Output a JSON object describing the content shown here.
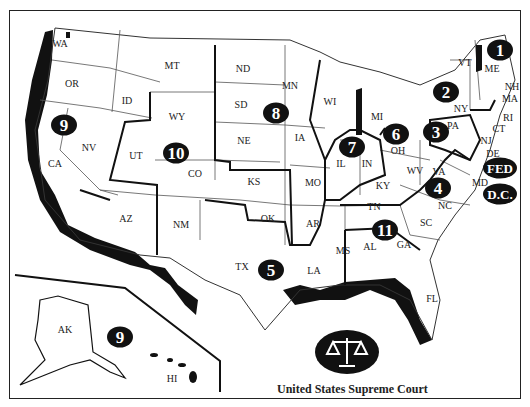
{
  "map": {
    "title": "United States Supreme Court",
    "seal_icon": "scales-of-justice",
    "colors": {
      "border": "#111111",
      "background": "#ffffff",
      "badge": "#111111",
      "badge_text": "#ffffff"
    },
    "states": [
      {
        "abbr": "WA",
        "x": 60,
        "y": 43
      },
      {
        "abbr": "OR",
        "x": 72,
        "y": 83
      },
      {
        "abbr": "CA",
        "x": 55,
        "y": 163
      },
      {
        "abbr": "NV",
        "x": 89,
        "y": 147
      },
      {
        "abbr": "ID",
        "x": 127,
        "y": 100
      },
      {
        "abbr": "MT",
        "x": 172,
        "y": 65
      },
      {
        "abbr": "WY",
        "x": 177,
        "y": 116
      },
      {
        "abbr": "UT",
        "x": 136,
        "y": 155
      },
      {
        "abbr": "CO",
        "x": 195,
        "y": 173
      },
      {
        "abbr": "AZ",
        "x": 126,
        "y": 218
      },
      {
        "abbr": "NM",
        "x": 181,
        "y": 224
      },
      {
        "abbr": "ND",
        "x": 243,
        "y": 68
      },
      {
        "abbr": "SD",
        "x": 241,
        "y": 104
      },
      {
        "abbr": "NE",
        "x": 244,
        "y": 140
      },
      {
        "abbr": "KS",
        "x": 254,
        "y": 181
      },
      {
        "abbr": "OK",
        "x": 268,
        "y": 218
      },
      {
        "abbr": "TX",
        "x": 242,
        "y": 266
      },
      {
        "abbr": "MN",
        "x": 290,
        "y": 85
      },
      {
        "abbr": "IA",
        "x": 300,
        "y": 137
      },
      {
        "abbr": "MO",
        "x": 313,
        "y": 182
      },
      {
        "abbr": "AR",
        "x": 313,
        "y": 223
      },
      {
        "abbr": "LA",
        "x": 314,
        "y": 270
      },
      {
        "abbr": "WI",
        "x": 330,
        "y": 101
      },
      {
        "abbr": "IL",
        "x": 341,
        "y": 163
      },
      {
        "abbr": "IN",
        "x": 367,
        "y": 163
      },
      {
        "abbr": "MI",
        "x": 377,
        "y": 116
      },
      {
        "abbr": "OH",
        "x": 398,
        "y": 150
      },
      {
        "abbr": "KY",
        "x": 383,
        "y": 185
      },
      {
        "abbr": "TN",
        "x": 374,
        "y": 206
      },
      {
        "abbr": "MS",
        "x": 343,
        "y": 250
      },
      {
        "abbr": "AL",
        "x": 370,
        "y": 246
      },
      {
        "abbr": "GA",
        "x": 404,
        "y": 244
      },
      {
        "abbr": "FL",
        "x": 432,
        "y": 298
      },
      {
        "abbr": "SC",
        "x": 426,
        "y": 222
      },
      {
        "abbr": "NC",
        "x": 445,
        "y": 205
      },
      {
        "abbr": "WV",
        "x": 415,
        "y": 170
      },
      {
        "abbr": "VA",
        "x": 439,
        "y": 171
      },
      {
        "abbr": "PA",
        "x": 453,
        "y": 125
      },
      {
        "abbr": "NY",
        "x": 461,
        "y": 108
      },
      {
        "abbr": "VT",
        "x": 465,
        "y": 62
      },
      {
        "abbr": "ME",
        "x": 492,
        "y": 68
      },
      {
        "abbr": "NH",
        "x": 512,
        "y": 86
      },
      {
        "abbr": "MA",
        "x": 510,
        "y": 98
      },
      {
        "abbr": "RI",
        "x": 508,
        "y": 117
      },
      {
        "abbr": "CT",
        "x": 499,
        "y": 128
      },
      {
        "abbr": "NJ",
        "x": 486,
        "y": 140
      },
      {
        "abbr": "DE",
        "x": 493,
        "y": 153
      },
      {
        "abbr": "MD",
        "x": 480,
        "y": 182
      },
      {
        "abbr": "AK",
        "x": 65,
        "y": 329
      },
      {
        "abbr": "HI",
        "x": 172,
        "y": 378
      }
    ],
    "circuits": [
      {
        "label": "1",
        "x": 500,
        "y": 50,
        "wide": false
      },
      {
        "label": "2",
        "x": 446,
        "y": 92,
        "wide": false
      },
      {
        "label": "3",
        "x": 436,
        "y": 132,
        "wide": false
      },
      {
        "label": "4",
        "x": 438,
        "y": 188,
        "wide": false
      },
      {
        "label": "5",
        "x": 271,
        "y": 270,
        "wide": false
      },
      {
        "label": "6",
        "x": 396,
        "y": 134,
        "wide": false
      },
      {
        "label": "7",
        "x": 352,
        "y": 147,
        "wide": false
      },
      {
        "label": "8",
        "x": 276,
        "y": 113,
        "wide": false
      },
      {
        "label": "9",
        "x": 64,
        "y": 125,
        "wide": false
      },
      {
        "label": "10",
        "x": 176,
        "y": 153,
        "wide": false
      },
      {
        "label": "11",
        "x": 385,
        "y": 230,
        "wide": false
      },
      {
        "label": "9",
        "x": 120,
        "y": 337,
        "wide": false
      },
      {
        "label": "FED",
        "x": 500,
        "y": 168,
        "wide": true
      },
      {
        "label": "D.C.",
        "x": 500,
        "y": 194,
        "wide": true
      }
    ]
  }
}
